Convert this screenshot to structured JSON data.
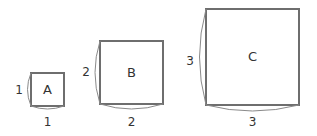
{
  "diagram": {
    "squares": [
      {
        "label": "A",
        "side_label": "1",
        "bottom_label": "1"
      },
      {
        "label": "B",
        "side_label": "2",
        "bottom_label": "2"
      },
      {
        "label": "C",
        "side_label": "3",
        "bottom_label": "3"
      }
    ],
    "colors": {
      "stroke": "#6e6e6e",
      "arc": "#8a8a8a",
      "text": "#333333"
    }
  }
}
